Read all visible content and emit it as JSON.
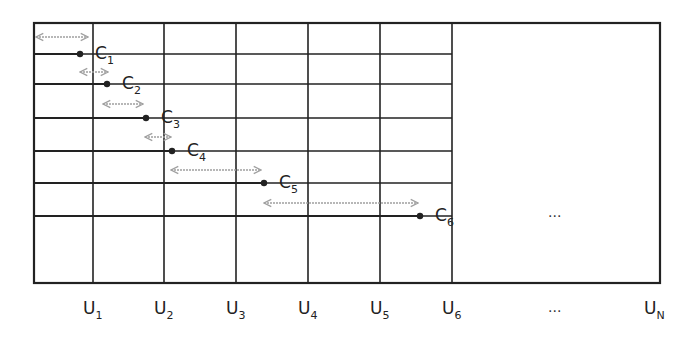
{
  "diagram": {
    "colors": {
      "line": "#222222",
      "arrow": "#a0a0a0",
      "background": "#ffffff"
    },
    "box": {
      "x": 34,
      "y": 23,
      "right": 660,
      "bottom": 283
    },
    "columns": [
      {
        "label": "U",
        "sub": "1",
        "x": 93
      },
      {
        "label": "U",
        "sub": "2",
        "x": 164
      },
      {
        "label": "U",
        "sub": "3",
        "x": 236
      },
      {
        "label": "U",
        "sub": "4",
        "x": 308
      },
      {
        "label": "U",
        "sub": "5",
        "x": 380
      },
      {
        "label": "U",
        "sub": "6",
        "x": 452
      }
    ],
    "last_column": {
      "label": "U",
      "sub": "N",
      "x": 660
    },
    "ellipsis_axis": "...",
    "ellipsis_grid": "...",
    "channels": [
      {
        "label": "C",
        "sub": "1",
        "y": 54,
        "end_x": 80,
        "arrow": {
          "y": 37,
          "x1": 36,
          "x2": 88
        }
      },
      {
        "label": "C",
        "sub": "2",
        "y": 84,
        "end_x": 107,
        "arrow": {
          "y": 72,
          "x1": 80,
          "x2": 108
        }
      },
      {
        "label": "C",
        "sub": "3",
        "y": 118,
        "end_x": 146,
        "arrow": {
          "y": 104,
          "x1": 103,
          "x2": 143
        }
      },
      {
        "label": "C",
        "sub": "4",
        "y": 151,
        "end_x": 172,
        "arrow": {
          "y": 137,
          "x1": 145,
          "x2": 171
        }
      },
      {
        "label": "C",
        "sub": "5",
        "y": 183,
        "end_x": 264,
        "arrow": {
          "y": 170,
          "x1": 171,
          "x2": 261
        }
      },
      {
        "label": "C",
        "sub": "6",
        "y": 216,
        "end_x": 420,
        "arrow": {
          "y": 203,
          "x1": 264,
          "x2": 418
        }
      }
    ]
  }
}
